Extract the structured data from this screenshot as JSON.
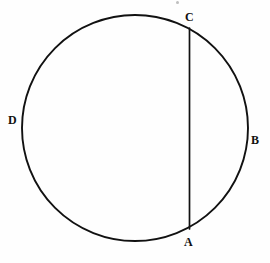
{
  "figure": {
    "type": "geometric-diagram",
    "background_color": "#fefefe",
    "ink_color": "#111111",
    "canvas": {
      "width": 270,
      "height": 263
    }
  },
  "circle": {
    "name": "circle-outline",
    "center_x": 135,
    "center_y": 128,
    "radius": 113,
    "stroke_width": 1.9,
    "stroke_color": "#111111",
    "fill": "none"
  },
  "chord": {
    "name": "chord-CA",
    "from_label": "C",
    "to_label": "A",
    "x1": 189.5,
    "y1": 28,
    "x2": 189.5,
    "y2": 229,
    "stroke_width": 1.7,
    "stroke_color": "#111111"
  },
  "labels": [
    {
      "id": "label-c",
      "text": "C",
      "x": 185,
      "y": 11,
      "point_x": 189.5,
      "point_y": 28
    },
    {
      "id": "label-b",
      "text": "B",
      "x": 251,
      "y": 134,
      "point_x": 248,
      "point_y": 128
    },
    {
      "id": "label-d",
      "text": "D",
      "x": 8,
      "y": 114,
      "point_x": 22,
      "point_y": 128
    },
    {
      "id": "label-a",
      "text": "A",
      "x": 184,
      "y": 236,
      "point_x": 189.5,
      "point_y": 229
    }
  ],
  "artifacts": [
    {
      "id": "scan-speck-top",
      "x": 176,
      "y": 1,
      "size": 3
    }
  ]
}
